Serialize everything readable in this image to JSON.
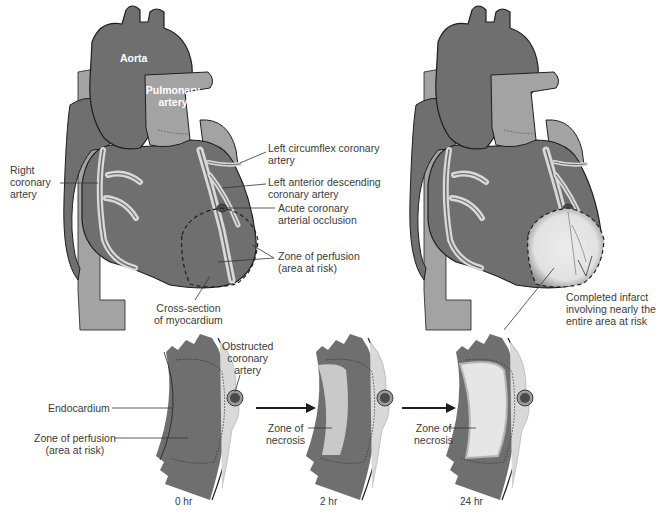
{
  "diagram": {
    "colors": {
      "myocardium": "#6f6f6f",
      "vessel_light": "#a3a3a3",
      "fat_highlight": "#d9d9d9",
      "necrosis": "#e6e6e6",
      "outline": "#1e1e1e",
      "label_text": "#3b3b3b"
    },
    "left_heart": {
      "labels": {
        "aorta": "Aorta",
        "pulmonary_artery_1": "Pulmonary",
        "pulmonary_artery_2": "artery",
        "right_coronary_1": "Right",
        "right_coronary_2": "coronary",
        "right_coronary_3": "artery",
        "left_circumflex_1": "Left circumflex coronary",
        "left_circumflex_2": "artery",
        "lad_1": "Left anterior descending",
        "lad_2": "coronary artery",
        "occlusion_1": "Acute coronary",
        "occlusion_2": "arterial occlusion",
        "perfusion_1": "Zone of perfusion",
        "perfusion_2": "(area at risk)",
        "cross_section_1": "Cross-section",
        "cross_section_2": "of myocardium"
      }
    },
    "right_heart": {
      "labels": {
        "infarct_1": "Completed infarct",
        "infarct_2": "involving nearly the",
        "infarct_3": "entire area at risk"
      }
    },
    "cross_sections": [
      {
        "time": "0 hr",
        "labels": {
          "obstructed_1": "Obstructed",
          "obstructed_2": "coronary",
          "obstructed_3": "artery",
          "endocardium": "Endocardium",
          "perfusion_1": "Zone of perfusion",
          "perfusion_2": "(area at risk)"
        }
      },
      {
        "time": "2 hr",
        "labels": {
          "necrosis_1": "Zone of",
          "necrosis_2": "necrosis"
        }
      },
      {
        "time": "24 hr",
        "labels": {
          "necrosis_1": "Zone of",
          "necrosis_2": "necrosis"
        }
      }
    ]
  }
}
